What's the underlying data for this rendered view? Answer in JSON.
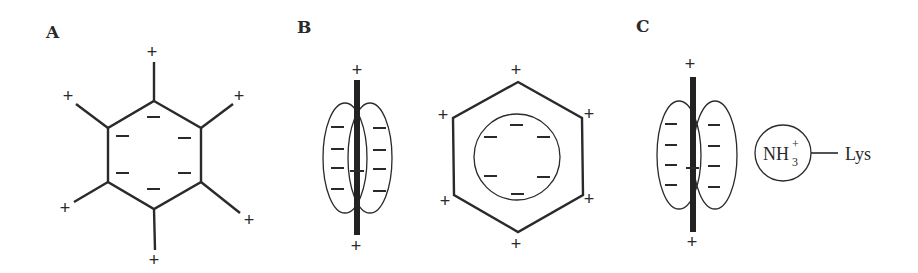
{
  "panels": [
    {
      "id": "A",
      "label": "A",
      "description": "Benzene ring with six partial negative charges inside and six positive charges at spoke ends",
      "negative_symbol": "−",
      "positive_symbol": "+",
      "negative_count": 6,
      "positive_count": 6
    },
    {
      "id": "B",
      "label": "B",
      "description": "Side view of aromatic ring with pi-electron clouds (lobes) and top view hexagon with inner circle of negative charge",
      "side_view": {
        "negative_count": 8,
        "positive_count": 2
      },
      "top_view": {
        "negative_count": 6,
        "positive_count": 6
      },
      "negative_symbol": "−",
      "positive_symbol": "+"
    },
    {
      "id": "C",
      "label": "C",
      "description": "Cation-pi interaction between aromatic ring and lysine ammonium group",
      "ring": {
        "negative_count": 8,
        "positive_count": 2
      },
      "cation": {
        "main": "NH",
        "subscript": "3",
        "superscript": "+"
      },
      "residue": "Lys",
      "negative_symbol": "−",
      "positive_symbol": "+"
    }
  ],
  "colors": {
    "ink": "#2a2a2a",
    "background": "#ffffff"
  }
}
